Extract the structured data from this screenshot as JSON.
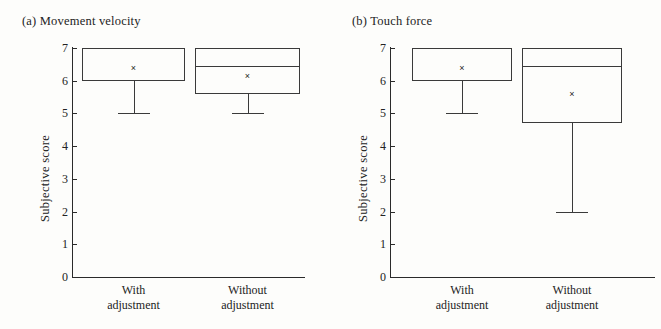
{
  "figure": {
    "background": "#fdfdfb",
    "line_color": "#3a3a3a"
  },
  "panels": [
    {
      "title": "(a) Movement velocity",
      "ylabel": "Subjective score",
      "categories": [
        "With\nadjustment",
        "Without\nadjustment"
      ],
      "category_lines": [
        [
          "With",
          "adjustment"
        ],
        [
          "Without",
          "adjustment"
        ]
      ]
    },
    {
      "title": "(b) Touch force",
      "ylabel": "Subjective score",
      "categories": [
        "With\nadjustment",
        "Without\nadjustment"
      ],
      "category_lines": [
        [
          "With",
          "adjustment"
        ],
        [
          "Without",
          "adjustment"
        ]
      ]
    }
  ],
  "axis": {
    "ticks": [
      "0",
      "1",
      "2",
      "3",
      "4",
      "5",
      "6",
      "7"
    ],
    "ylim": [
      0,
      7
    ]
  },
  "chart_data": [
    {
      "type": "box",
      "title": "(a) Movement velocity",
      "xlabel": "",
      "ylabel": "Subjective score",
      "ylim": [
        0,
        7
      ],
      "yticks": [
        0,
        1,
        2,
        3,
        4,
        5,
        6,
        7
      ],
      "grid": false,
      "legend": "none",
      "categories": [
        "With adjustment",
        "Without adjustment"
      ],
      "boxes": [
        {
          "category": "With adjustment",
          "q1": 6.0,
          "median": 7.0,
          "q3": 7.0,
          "whisker_low": 5.0,
          "whisker_high": 7.0,
          "mean": 6.4,
          "median_line_visible": false
        },
        {
          "category": "Without adjustment",
          "q1": 5.6,
          "median": 6.45,
          "q3": 7.0,
          "whisker_low": 5.0,
          "whisker_high": 7.0,
          "mean": 6.15,
          "median_line_visible": true
        }
      ]
    },
    {
      "type": "box",
      "title": "(b) Touch force",
      "xlabel": "",
      "ylabel": "Subjective score",
      "ylim": [
        0,
        7
      ],
      "yticks": [
        0,
        1,
        2,
        3,
        4,
        5,
        6,
        7
      ],
      "grid": false,
      "legend": "none",
      "categories": [
        "With adjustment",
        "Without adjustment"
      ],
      "boxes": [
        {
          "category": "With adjustment",
          "q1": 6.0,
          "median": 7.0,
          "q3": 7.0,
          "whisker_low": 5.0,
          "whisker_high": 7.0,
          "mean": 6.4,
          "median_line_visible": false
        },
        {
          "category": "Without adjustment",
          "q1": 4.7,
          "median": 6.45,
          "q3": 7.0,
          "whisker_low": 2.0,
          "whisker_high": 7.0,
          "mean": 5.6,
          "median_line_visible": true
        }
      ]
    }
  ],
  "marker": {
    "mean_glyph": "×"
  }
}
